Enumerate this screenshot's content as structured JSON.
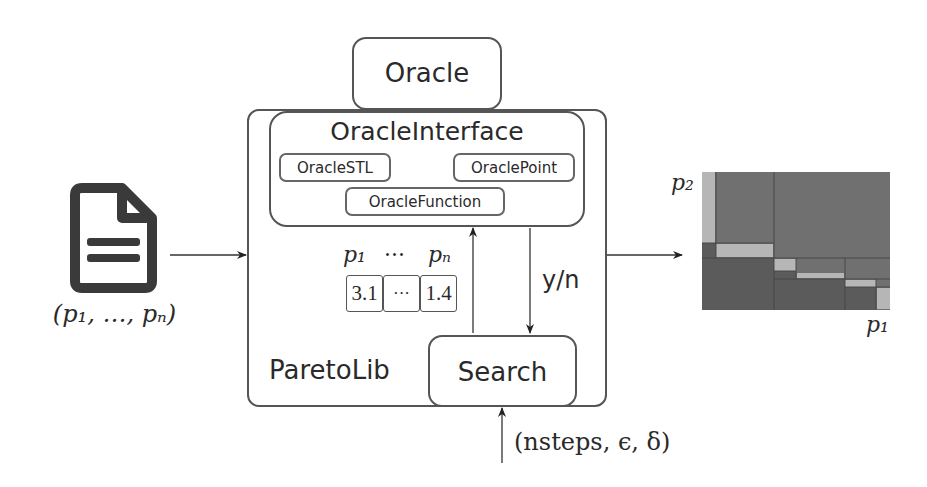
{
  "diagram": {
    "input": {
      "icon": "document-icon",
      "label": "(p₁, …, pₙ)"
    },
    "oracle": {
      "label": "Oracle"
    },
    "paretolib": {
      "label": "ParetoLib",
      "oracle_interface": {
        "label": "OracleInterface",
        "implementations": [
          "OracleSTL",
          "OraclePoint",
          "OracleFunction"
        ]
      },
      "point": {
        "header_first": "p₁",
        "header_dots": "···",
        "header_last": "pₙ",
        "cells": [
          "3.1",
          "···",
          "1.4"
        ]
      },
      "answer_label": "y/n",
      "search": {
        "label": "Search"
      }
    },
    "search_params": "(nsteps, ϵ, δ)",
    "output_plot": {
      "y_axis_label": "p₂",
      "x_axis_label": "p₁"
    },
    "colors": {
      "stroke": "#555555",
      "plot_medium": "#707070",
      "plot_dark": "#5b5b5b",
      "plot_light": "#b6b6b6"
    }
  }
}
